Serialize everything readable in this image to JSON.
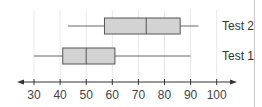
{
  "chart_data": {
    "type": "boxplot",
    "title": "",
    "xlabel": "",
    "ylabel": "",
    "orientation": "horizontal",
    "xlim": [
      30,
      100
    ],
    "x_ticks": [
      30,
      40,
      50,
      60,
      70,
      80,
      90,
      100
    ],
    "x_tick_labels": [
      "30",
      "40",
      "50",
      "60",
      "70",
      "80",
      "90",
      "100"
    ],
    "grid": "vertical",
    "axis_arrows": true,
    "series": [
      {
        "name": "Test 2",
        "min": 43,
        "q1": 57,
        "median": 73,
        "q3": 86,
        "max": 93
      },
      {
        "name": "Test 1",
        "min": 30,
        "q1": 41,
        "median": 50,
        "q3": 61,
        "max": 90
      }
    ],
    "colors": {
      "box_fill": "#d3d3d3",
      "box_stroke": "#555555",
      "whisker": "#666666",
      "grid": "#e8e8e8",
      "axis": "#333333"
    }
  }
}
